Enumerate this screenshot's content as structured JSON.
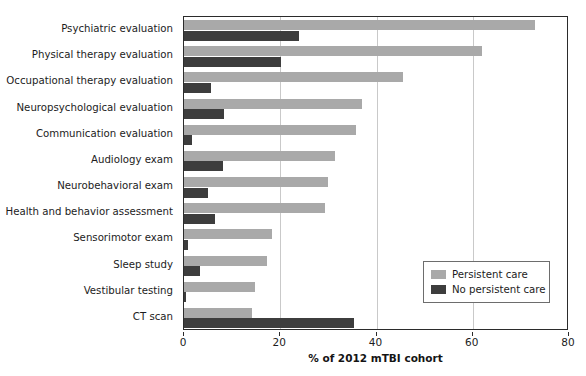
{
  "chart_data": {
    "type": "bar",
    "orientation": "horizontal",
    "title": "",
    "xlabel": "% of 2012 mTBI cohort",
    "ylabel": "",
    "xlim": [
      0,
      80
    ],
    "xticks": [
      0,
      20,
      40,
      60,
      80
    ],
    "xtick_labels": [
      "0",
      "20",
      "40",
      "60",
      "80"
    ],
    "grid": "vertical",
    "legend_position": "bottom-right",
    "categories": [
      "Psychiatric evaluation",
      "Physical therapy evaluation",
      "Occupational therapy evaluation",
      "Neuropsychological evaluation",
      "Communication evaluation",
      "Audiology exam",
      "Neurobehavioral exam",
      "Health and behavior assessment",
      "Sensorimotor exam",
      "Sleep study",
      "Vestibular testing",
      "CT scan"
    ],
    "series": [
      {
        "name": "Persistent care",
        "color": "#a9a9a9",
        "values": [
          73.0,
          62.0,
          45.5,
          37.0,
          35.8,
          31.4,
          30.0,
          29.3,
          18.3,
          17.3,
          14.8,
          14.1
        ]
      },
      {
        "name": "No persistent care",
        "color": "#3d3d3d",
        "values": [
          23.9,
          20.2,
          5.6,
          8.3,
          1.7,
          8.2,
          5.0,
          6.5,
          0.8,
          3.3,
          0.5,
          35.4
        ]
      }
    ]
  },
  "legend": {
    "items": [
      {
        "label": "Persistent care",
        "color": "#a9a9a9"
      },
      {
        "label": "No persistent care",
        "color": "#3d3d3d"
      }
    ]
  },
  "axis": {
    "x_title": "% of 2012 mTBI cohort"
  }
}
